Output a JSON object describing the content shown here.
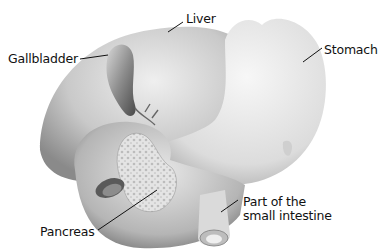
{
  "diagram": {
    "style": "grayscale anatomical illustration",
    "labels": [
      {
        "id": "liver",
        "text": "Liver"
      },
      {
        "id": "gallbladder",
        "text": "Gallbladder"
      },
      {
        "id": "stomach",
        "text": "Stomach"
      },
      {
        "id": "pancreas",
        "text": "Pancreas"
      },
      {
        "id": "small-intestine",
        "line1": "Part of the",
        "line2": "small intestine"
      }
    ]
  }
}
